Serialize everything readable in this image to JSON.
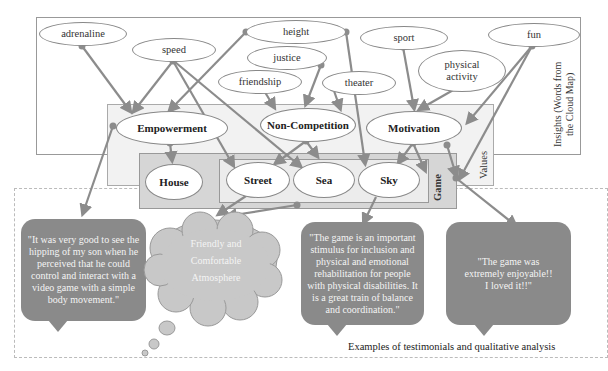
{
  "insights": {
    "label": "Insights (Words from the Cloud Map)",
    "words": [
      "adrenaline",
      "speed",
      "height",
      "justice",
      "friendship",
      "theater",
      "sport",
      "physical activity",
      "fun"
    ]
  },
  "values": {
    "label": "Values",
    "items": [
      "Empowerment",
      "Non-Competition",
      "Motivation"
    ]
  },
  "game": {
    "label": "Game",
    "items": [
      "House",
      "Street",
      "Sea",
      "Sky"
    ]
  },
  "testimonials": {
    "caption": "Examples of testimonials and qualitative analysis",
    "quote1": "\"It was very good to see the hipping of my son when he perceived that he could control and interact with a video game with a simple body movement.\"",
    "cloud": [
      "Friendly and",
      "Comfortable",
      "Atmosphere"
    ],
    "quote2": "\"The game is an important stimulus for inclusion and physical and emotional rehabilitation for people with physical disabilities. It is a great train of balance and coordination.\"",
    "quote3": "\"The game was extremely enjoyable!! I loved it!!\""
  },
  "colors": {
    "arrow": "#8c8c8c",
    "values_fill": "#f2f2f2",
    "game_fill": "#d6d6d6",
    "game_inner_fill": "#ececec",
    "bubble_fill": "#8a8a8a",
    "cloud_fill": "#c8c8c8"
  }
}
